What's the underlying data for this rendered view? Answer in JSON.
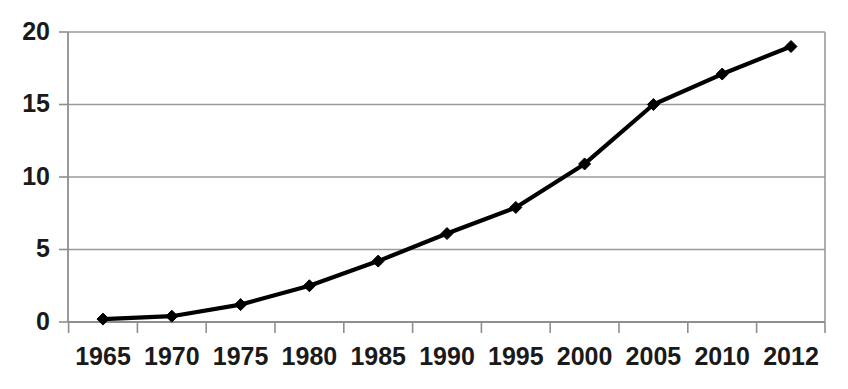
{
  "chart_data": {
    "type": "line",
    "title": "",
    "subtitle": "",
    "xlabel": "",
    "ylabel": "",
    "categories": [
      "1965",
      "1970",
      "1975",
      "1980",
      "1985",
      "1990",
      "1995",
      "2000",
      "2005",
      "2010",
      "2012"
    ],
    "values": [
      0.2,
      0.4,
      1.2,
      2.5,
      4.2,
      6.1,
      7.9,
      10.9,
      15.0,
      17.1,
      19.0
    ],
    "series": [
      {
        "name": "",
        "values": [
          0.2,
          0.4,
          1.2,
          2.5,
          4.2,
          6.1,
          7.9,
          10.9,
          15.0,
          17.1,
          19.0
        ],
        "color": "#000000",
        "marker": "diamond"
      }
    ],
    "ylim": [
      0,
      20
    ],
    "yticks": [
      0,
      5,
      10,
      15,
      20
    ],
    "ytick_labels": [
      "0",
      "5",
      "10",
      "15",
      "20"
    ],
    "xtick_labels": [
      "1965",
      "1970",
      "1975",
      "1980",
      "1985",
      "1990",
      "1995",
      "2000",
      "2005",
      "2010",
      "2012"
    ],
    "grid": true,
    "grid_axis": "y",
    "grid_color": "#9a9a9a",
    "legend": false,
    "legend_position": "none",
    "annotations": [],
    "axis_color": "#8e8e8e",
    "text_color": "#1a1a1a",
    "background": "#ffffff"
  },
  "layout": {
    "plot_left": 68,
    "plot_right": 825,
    "plot_top": 32,
    "plot_bottom": 322,
    "category_step": 68.8,
    "first_category_center": 103,
    "marker_size": 12,
    "width": 848,
    "height": 389
  }
}
